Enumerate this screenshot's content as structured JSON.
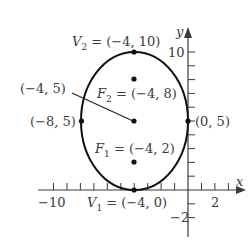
{
  "diagram": {
    "type": "ellipse-graph",
    "axes": {
      "x_label": "x",
      "y_label": "y",
      "x_tick_labels": [
        "−10",
        "2"
      ],
      "y_tick_labels": [
        "10",
        "−2"
      ]
    },
    "ellipse": {
      "center": [
        -4,
        5
      ],
      "semi_axis_horizontal": 4,
      "semi_axis_vertical": 5
    },
    "points": {
      "V2": {
        "name": "V",
        "sub": "2",
        "text": " = (−4, 10)",
        "coords": [
          -4,
          10
        ]
      },
      "F2": {
        "name": "F",
        "sub": "2",
        "text": " = (−4, 8)",
        "coords": [
          -4,
          8
        ]
      },
      "center": {
        "text": "(−4, 5)",
        "coords": [
          -4,
          5
        ]
      },
      "left_vertex": {
        "text": "(−8, 5)",
        "coords": [
          -8,
          5
        ]
      },
      "right_vertex": {
        "text": "(0, 5)",
        "coords": [
          0,
          5
        ]
      },
      "F1": {
        "name": "F",
        "sub": "1",
        "text": " = (−4, 2)",
        "coords": [
          -4,
          2
        ]
      },
      "V1": {
        "name": "V",
        "sub": "1",
        "text": " = (−4, 0)",
        "coords": [
          -4,
          0
        ]
      }
    }
  }
}
